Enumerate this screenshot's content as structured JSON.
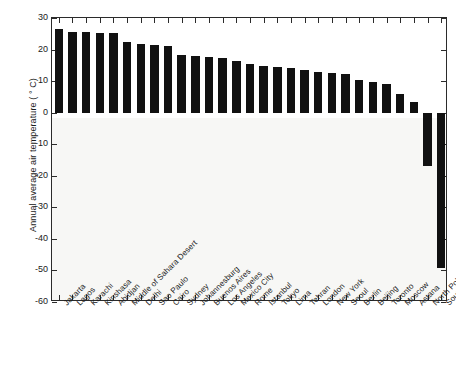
{
  "chart_data": {
    "type": "bar",
    "title": "",
    "xlabel": "",
    "ylabel": "Annual average air temperature ( ° C)",
    "ylim": [
      -60,
      30
    ],
    "yticks": [
      30,
      20,
      10,
      0,
      -10,
      -20,
      -30,
      -40,
      -50,
      -60
    ],
    "ytick_labels": [
      "30",
      "20",
      "10",
      "0",
      "-10",
      "-20",
      "-30",
      "-40",
      "-50",
      "-60"
    ],
    "grid": false,
    "legend": null,
    "categories": [
      "Jakarta",
      "Lagos",
      "Karachi",
      "Kinshasa",
      "Abidjan",
      "Middle of Sahara Desert",
      "Delhi",
      "Sao Paulo",
      "Cairo",
      "Sydney",
      "Johannesburg",
      "Buenos Aires",
      "Los Angeles",
      "Mexico City",
      "Rome",
      "Istanbul",
      "Tokyo",
      "Lima",
      "Tehran",
      "London",
      "New York",
      "Seoul",
      "Berlin",
      "Beijing",
      "Toronto",
      "Moscow",
      "Astana",
      "North Pole",
      "South Pole"
    ],
    "values": [
      26.5,
      25.7,
      25.7,
      25.3,
      25.2,
      22.5,
      21.8,
      21.3,
      21.2,
      18.3,
      17.8,
      17.5,
      17.2,
      16.5,
      15.3,
      14.7,
      14.5,
      14.2,
      13.6,
      13.0,
      12.6,
      12.2,
      10.3,
      9.8,
      9.1,
      5.8,
      3.5,
      -17.0,
      -49.3
    ],
    "bar_color": "#111111"
  }
}
